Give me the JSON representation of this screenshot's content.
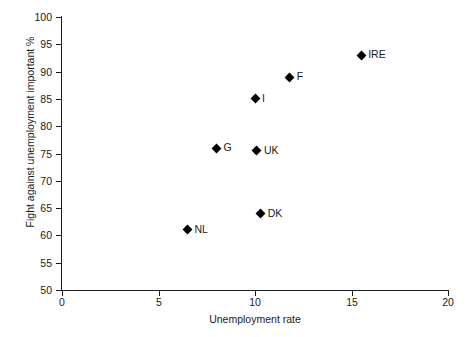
{
  "chart_data": {
    "type": "scatter",
    "title": "",
    "subtitle": "",
    "xlabel": "Unemployment rate",
    "ylabel": "Fight against unemployment important %",
    "xlim": [
      0,
      20
    ],
    "ylim": [
      50,
      100
    ],
    "xticks": [
      0,
      5,
      10,
      15,
      20
    ],
    "yticks": [
      50,
      55,
      60,
      65,
      70,
      75,
      80,
      85,
      90,
      95,
      100
    ],
    "xtick_labels": [
      "0",
      "5",
      "10",
      "15",
      "20"
    ],
    "ytick_labels": [
      "50",
      "55",
      "60",
      "65",
      "70",
      "75",
      "80",
      "85",
      "90",
      "95",
      "100"
    ],
    "grid": false,
    "legend": null,
    "marker": "diamond",
    "marker_color": "#000000",
    "background_color": "#ffffff",
    "axis_color": "#1a1a1a",
    "points": [
      {
        "label": "NL",
        "x": 6.5,
        "y": 61
      },
      {
        "label": "G",
        "x": 8.0,
        "y": 76
      },
      {
        "label": "I",
        "x": 10.0,
        "y": 85
      },
      {
        "label": "UK",
        "x": 10.1,
        "y": 75.5
      },
      {
        "label": "DK",
        "x": 10.3,
        "y": 64
      },
      {
        "label": "F",
        "x": 11.8,
        "y": 89
      },
      {
        "label": "IRE",
        "x": 15.5,
        "y": 93
      }
    ]
  }
}
